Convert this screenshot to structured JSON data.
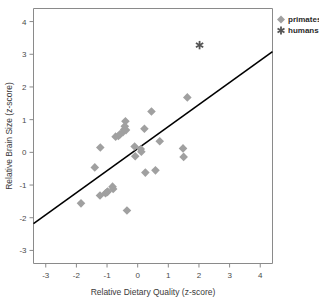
{
  "chart_data": {
    "type": "scatter",
    "title": "",
    "xlabel": "Relative Dietary Quality (z-score)",
    "ylabel": "Relative Brain Size (z-score)",
    "xlim": [
      -3.4,
      4.4
    ],
    "ylim": [
      -3.4,
      4.4
    ],
    "xticks": [
      -3,
      -2,
      -1,
      0,
      1,
      2,
      3,
      4
    ],
    "xticklabels": [
      "-3",
      "-2",
      "-1",
      "0",
      "1",
      "2",
      "3",
      "4"
    ],
    "yticks": [
      -3,
      -2,
      -1,
      0,
      1,
      2,
      3,
      4
    ],
    "yticklabels": [
      "-3",
      "-2",
      "-1",
      "0",
      "1",
      "2",
      "3",
      "4"
    ],
    "grid": false,
    "legend_position": "top-right",
    "series": [
      {
        "name": "primates",
        "marker": "diamond",
        "color": "#a0a0a0",
        "points": [
          [
            -1.85,
            -1.56
          ],
          [
            -1.4,
            -0.46
          ],
          [
            -1.22,
            0.15
          ],
          [
            -1.23,
            -1.32
          ],
          [
            -1.05,
            -1.25
          ],
          [
            -1.0,
            -1.22
          ],
          [
            -0.98,
            -1.2
          ],
          [
            -0.82,
            -1.05
          ],
          [
            -0.8,
            -1.12
          ],
          [
            -0.72,
            0.48
          ],
          [
            -0.63,
            0.5
          ],
          [
            -0.58,
            0.55
          ],
          [
            -0.48,
            0.62
          ],
          [
            -0.44,
            0.7
          ],
          [
            -0.42,
            0.8
          ],
          [
            -0.4,
            0.95
          ],
          [
            -0.38,
            0.68
          ],
          [
            -0.35,
            -1.78
          ],
          [
            -0.1,
            0.18
          ],
          [
            -0.08,
            -0.12
          ],
          [
            0.1,
            0.1
          ],
          [
            0.12,
            0.02
          ],
          [
            0.22,
            0.72
          ],
          [
            0.25,
            -0.62
          ],
          [
            0.45,
            1.25
          ],
          [
            0.58,
            -0.55
          ],
          [
            0.72,
            0.34
          ],
          [
            1.48,
            0.12
          ],
          [
            1.5,
            -0.14
          ],
          [
            1.62,
            1.68
          ]
        ]
      },
      {
        "name": "humans",
        "marker": "asterisk",
        "color": "#555555",
        "points": [
          [
            2.02,
            3.28
          ]
        ]
      }
    ],
    "fit_line": {
      "name": "regression-line",
      "color": "#000000",
      "x_start": -3.4,
      "y_start": -2.18,
      "x_end": 4.4,
      "y_end": 3.08
    }
  },
  "legend": {
    "items": [
      {
        "label": "primates",
        "marker": "diamond",
        "color": "#a0a0a0"
      },
      {
        "label": "humans",
        "marker": "asterisk",
        "color": "#555555"
      }
    ]
  },
  "axes": {
    "x_title": "Relative Dietary Quality (z-score)",
    "y_title": "Relative Brain Size (z-score)"
  }
}
